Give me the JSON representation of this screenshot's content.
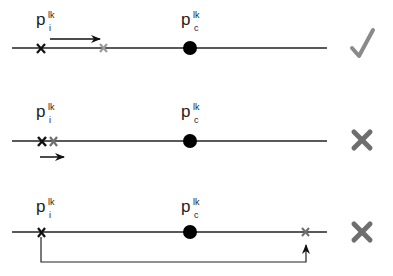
{
  "rows": [
    {
      "label_i": {
        "base": "p",
        "sup": "lk",
        "sub": "i"
      },
      "label_c": {
        "base": "p",
        "sup": "lk",
        "sub": "c"
      },
      "verdict": "check",
      "verdict_color": "#8a8a8a"
    },
    {
      "label_i": {
        "base": "p",
        "sup": "lk",
        "sub": "i"
      },
      "label_c": {
        "base": "p",
        "sup": "lk",
        "sub": "c"
      },
      "verdict": "cross",
      "verdict_color": "#6e6e6e"
    },
    {
      "label_i": {
        "base": "p",
        "sup": "lk",
        "sub": "i"
      },
      "label_c": {
        "base": "p",
        "sup": "lk",
        "sub": "c"
      },
      "verdict": "cross",
      "verdict_color": "#6e6e6e"
    }
  ],
  "colors": {
    "line": "#222222",
    "marker_current": "#111111",
    "marker_moved": "#9a9a9a",
    "center_dot": "#000000"
  }
}
